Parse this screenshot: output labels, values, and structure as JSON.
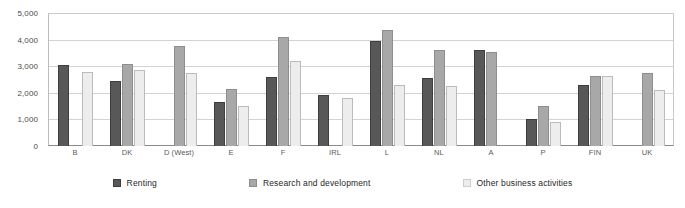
{
  "chart_data": {
    "type": "bar",
    "title": "",
    "subtitle": "",
    "xlabel": "",
    "ylabel": "",
    "ylim": [
      0,
      5000
    ],
    "ytick_values": [
      0,
      1000,
      2000,
      3000,
      4000,
      5000
    ],
    "ytick_labels": [
      "0",
      "1,000",
      "2,000",
      "3,000",
      "4,000",
      "5,000"
    ],
    "grid": true,
    "legend_position": "bottom",
    "categories": [
      "B",
      "DK",
      "D (West)",
      "E",
      "F",
      "IRL",
      "L",
      "NL",
      "A",
      "P",
      "FIN",
      "UK"
    ],
    "series": [
      {
        "name": "Renting",
        "color": "#585858",
        "values": [
          3050,
          2450,
          null,
          1650,
          2600,
          1900,
          3950,
          2550,
          3600,
          1000,
          2300,
          null
        ]
      },
      {
        "name": "Research and development",
        "color": "#a8a8a8",
        "values": [
          null,
          3100,
          3750,
          2150,
          4100,
          null,
          4350,
          3600,
          3550,
          1500,
          2650,
          2750
        ]
      },
      {
        "name": "Other business activities",
        "color": "#ededed",
        "values": [
          2800,
          2850,
          2750,
          1500,
          3200,
          1800,
          2300,
          2250,
          null,
          900,
          2650,
          2100
        ]
      }
    ]
  },
  "legend": {
    "items": [
      {
        "label": "Renting"
      },
      {
        "label": "Research and development"
      },
      {
        "label": "Other business activities"
      }
    ]
  }
}
